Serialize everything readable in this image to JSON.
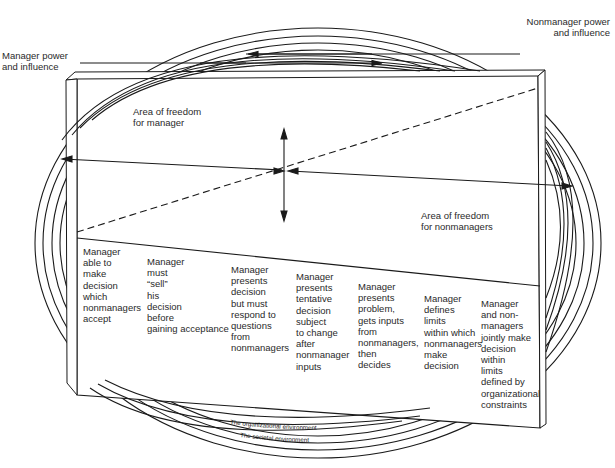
{
  "labels": {
    "manager_power": "Manager power\nand influence",
    "nonmanager_power": "Nonmanager power\nand influence",
    "area_manager": "Area of freedom\nfor manager",
    "area_nonmanagers": "Area of freedom\nfor nonmanagers"
  },
  "continuum": [
    {
      "id": "c1",
      "text": "Manager\nable to\nmake\ndecision\nwhich\nnonmanagers\naccept"
    },
    {
      "id": "c2",
      "text": "Manager\nmust\n“sell”\nhis\ndecision\nbefore\ngaining acceptance"
    },
    {
      "id": "c3",
      "text": "Manager\npresents\ndecision\nbut must\nrespond to\nquestions\nfrom\nnonmanagers"
    },
    {
      "id": "c4",
      "text": "Manager\npresents\ntentative\ndecision\nsubject\nto change\nafter\nnonmanager\ninputs"
    },
    {
      "id": "c5",
      "text": "Manager\npresents\nproblem,\ngets inputs\nfrom\nnonmanagers,\nthen\ndecides"
    },
    {
      "id": "c6",
      "text": "Manager\ndefines\nlimits\nwithin which\nnonmanagers\nmake\ndecision"
    },
    {
      "id": "c7",
      "text": "Manager\nand non-\nmanagers\njointly make\ndecision\nwithin\nlimits\ndefined by\norganizational\nconstraints"
    }
  ],
  "environments": {
    "organizational": "The organizational environment",
    "societal": "The societal environment"
  }
}
